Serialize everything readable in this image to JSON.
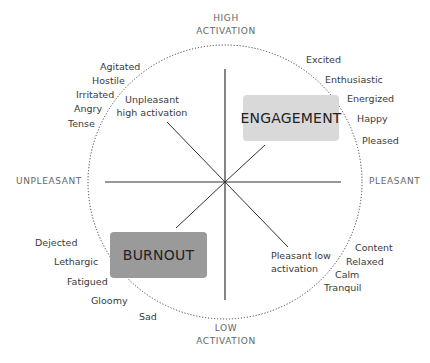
{
  "axes": {
    "top": [
      "HIGH",
      "ACTIVATION"
    ],
    "bottom": [
      "LOW",
      "ACTIVATION"
    ],
    "left": "UNPLEASANT",
    "right": "PLEASANT"
  },
  "boxes": {
    "engagement": {
      "label": "ENGAGEMENT",
      "color": "#d9d9d9"
    },
    "burnout": {
      "label": "BURNOUT",
      "color": "#999999"
    }
  },
  "quadrant_labels": {
    "unpleasant_high": [
      "Unpleasant",
      "high activation"
    ],
    "pleasant_low": [
      "Pleasant low",
      "activation"
    ]
  },
  "emotions": {
    "unpleasant_high": [
      "Agitated",
      "Hostile",
      "Irritated",
      "Angry",
      "Tense"
    ],
    "pleasant_high": [
      "Excited",
      "Enthusiastic",
      "Energized",
      "Happy",
      "Pleased"
    ],
    "unpleasant_low": [
      "Dejected",
      "Lethargic",
      "Fatigued",
      "Gloomy",
      "Sad"
    ],
    "pleasant_low": [
      "Content",
      "Relaxed",
      "Calm",
      "Tranquil"
    ]
  }
}
